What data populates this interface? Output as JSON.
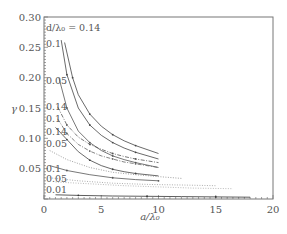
{
  "chart_data": {
    "type": "line",
    "title": "",
    "xlabel": "a/λ₀",
    "ylabel": "γ",
    "xlim": [
      0,
      20
    ],
    "ylim": [
      0,
      0.3
    ],
    "xticks": [
      0,
      5,
      10,
      15,
      20
    ],
    "yticks": [
      0.05,
      0.1,
      0.15,
      0.2,
      0.25,
      0.3
    ],
    "xtick_labels": [
      "0",
      "5",
      "10",
      "15",
      "20"
    ],
    "ytick_labels": [
      "0.05",
      "0.10",
      "0.15",
      "0.20",
      "0.25",
      "0.30"
    ],
    "grid": false,
    "legend_header": "d/λ₀ = 0.14",
    "curve_labels": [
      {
        "text": "d/λ₀ = 0.14",
        "y": 0.283
      },
      {
        "text": "0.1",
        "y": 0.256
      },
      {
        "text": "0.05",
        "y": 0.196
      },
      {
        "text": "0.14",
        "y": 0.152
      },
      {
        "text": "0.1",
        "y": 0.133
      },
      {
        "text": "0.14",
        "y": 0.111
      },
      {
        "text": "0.05",
        "y": 0.092
      },
      {
        "text": "0.1",
        "y": 0.05
      },
      {
        "text": "0.05",
        "y": 0.034
      },
      {
        "text": "0.01",
        "y": 0.016
      }
    ],
    "series": [
      {
        "name": "group1 d/λ₀=0.14",
        "style": "solid",
        "color": "#444444",
        "x": [
          1.5,
          2,
          3,
          4,
          5,
          6,
          7,
          8,
          10
        ],
        "y": [
          0.262,
          0.205,
          0.15,
          0.122,
          0.105,
          0.093,
          0.084,
          0.077,
          0.066
        ]
      },
      {
        "name": "group1 d/λ₀=0.1",
        "style": "solid",
        "color": "#444444",
        "x": [
          1.8,
          2.5,
          3,
          4,
          5,
          6,
          7,
          8,
          10
        ],
        "y": [
          0.258,
          0.2,
          0.172,
          0.14,
          0.12,
          0.106,
          0.096,
          0.088,
          0.075
        ]
      },
      {
        "name": "group1 d/λ₀=0.05",
        "style": "solid",
        "color": "#555555",
        "x": [
          1.3,
          2,
          3,
          4,
          5,
          6,
          7,
          8,
          10
        ],
        "y": [
          0.2,
          0.15,
          0.112,
          0.093,
          0.08,
          0.071,
          0.065,
          0.06,
          0.052
        ]
      },
      {
        "name": "group2 d/λ₀=0.14",
        "style": "dashdot",
        "color": "#555555",
        "x": [
          1.2,
          2,
          3,
          4,
          5,
          6,
          7,
          8,
          10
        ],
        "y": [
          0.152,
          0.122,
          0.102,
          0.09,
          0.082,
          0.075,
          0.07,
          0.066,
          0.06
        ]
      },
      {
        "name": "group2 d/λ₀=0.1",
        "style": "dashdot",
        "color": "#666666",
        "x": [
          1.2,
          2,
          3,
          4,
          5,
          6,
          7,
          8,
          10
        ],
        "y": [
          0.132,
          0.108,
          0.09,
          0.079,
          0.071,
          0.066,
          0.061,
          0.058,
          0.052
        ]
      },
      {
        "name": "group2 d/λ₀=0.14 b",
        "style": "solid",
        "color": "#444444",
        "x": [
          1.0,
          2,
          3,
          4,
          5,
          6,
          7,
          8,
          10
        ],
        "y": [
          0.118,
          0.098,
          0.078,
          0.064,
          0.055,
          0.049,
          0.045,
          0.042,
          0.038
        ]
      },
      {
        "name": "group2 d/λ₀=0.05",
        "style": "dotted",
        "color": "#888888",
        "x": [
          0.5,
          2,
          4,
          6,
          8,
          10,
          12
        ],
        "y": [
          0.08,
          0.065,
          0.052,
          0.044,
          0.04,
          0.037,
          0.034
        ]
      },
      {
        "name": "group3 d/λ₀=0.1",
        "style": "solid",
        "color": "#555555",
        "x": [
          0.5,
          2,
          4,
          6,
          8,
          10
        ],
        "y": [
          0.055,
          0.047,
          0.04,
          0.035,
          0.032,
          0.03
        ]
      },
      {
        "name": "group3 d/λ₀=0.05",
        "style": "dotted",
        "color": "#999999",
        "x": [
          0.5,
          3,
          6,
          9,
          12,
          15
        ],
        "y": [
          0.035,
          0.03,
          0.026,
          0.024,
          0.023,
          0.022
        ]
      },
      {
        "name": "group3 d/λ₀=0.05 b",
        "style": "dotted",
        "color": "#aaaaaa",
        "x": [
          1,
          4,
          7,
          10,
          13,
          16.5
        ],
        "y": [
          0.028,
          0.025,
          0.022,
          0.02,
          0.018,
          0.017
        ]
      },
      {
        "name": "d/λ₀=0.01",
        "style": "solid",
        "color": "#333333",
        "x": [
          1,
          3,
          6,
          9,
          12,
          15,
          18
        ],
        "y": [
          0.007,
          0.006,
          0.005,
          0.0045,
          0.004,
          0.0035,
          0.003
        ]
      }
    ]
  }
}
